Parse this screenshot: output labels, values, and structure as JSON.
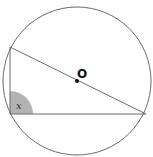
{
  "diagram": {
    "title": "",
    "type": "circle-inscribed-right-triangle",
    "colors": {
      "stroke": "#6b6b6b",
      "angle_fill": "#b3b3b3",
      "center_dot": "#111111",
      "background": "#ffffff"
    },
    "circle": {
      "cx": 77,
      "cy": 81,
      "r": 74
    },
    "center": {
      "label": "O",
      "x": 77,
      "y": 81
    },
    "triangle": {
      "vertices": [
        {
          "name": "A",
          "x": 10,
          "y": 47
        },
        {
          "name": "B",
          "x": 10,
          "y": 114
        },
        {
          "name": "C",
          "x": 146,
          "y": 114
        }
      ],
      "hypotenuse_through_center": true
    },
    "angle": {
      "label": "x",
      "vertex": "B",
      "radius": 23
    }
  }
}
